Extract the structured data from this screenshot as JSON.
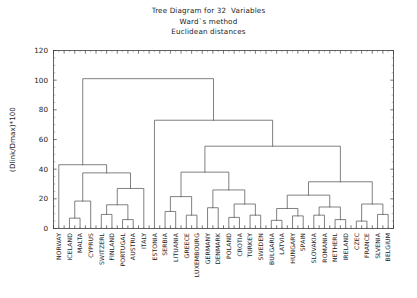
{
  "title": {
    "line1": "Tree Diagram for 32  Variables",
    "line2": "Ward`s method",
    "line3": "Euclidean distances"
  },
  "chart_data": {
    "type": "dendrogram",
    "title": "Tree Diagram for 32  Variables",
    "subtitle": "Ward`s method",
    "subtitle2": "Euclidean distances",
    "xlabel": "",
    "ylabel": "(Dlink/Dmax)*100",
    "ylim": [
      0,
      120
    ],
    "yticks": [
      0,
      20,
      40,
      60,
      80,
      100,
      120
    ],
    "ytick_labels": [
      "0",
      "20",
      "40",
      "60",
      "80",
      "100",
      "120"
    ],
    "grid": false,
    "legend": false,
    "leaf_count": 32,
    "leaves": [
      "NORWAY",
      "ICELAND",
      "MALTA",
      "CYPRUS",
      "SWITZERL",
      "FINLAND",
      "PORTUGAL",
      "AUSTRIA",
      "ITALY",
      "ESTONIA",
      "SERBIA",
      "LITUANIA",
      "GREECE",
      "LUXEMBOURG",
      "GERMANY",
      "DENMARK",
      "POLAND",
      "CROTIA",
      "TURKEY",
      "SWEDEN",
      "BULGARIA",
      "LATVIA",
      "HUNGARY",
      "SPAIN",
      "SLOVAKIA",
      "ROMANIA",
      "NETHERL",
      "IRELAND",
      "CZEC",
      "FRANCE",
      "SLVENIA",
      "BELGIUM"
    ],
    "merges": [
      {
        "id": "m1",
        "left": "ICELAND",
        "right": "MALTA",
        "height": 7.0
      },
      {
        "id": "m2",
        "left": "m1",
        "right": "CYPRUS",
        "height": 18.5
      },
      {
        "id": "m3",
        "left": "SWITZERL",
        "right": "FINLAND",
        "height": 9.5
      },
      {
        "id": "m4",
        "left": "PORTUGAL",
        "right": "AUSTRIA",
        "height": 6.0
      },
      {
        "id": "m5",
        "left": "m3",
        "right": "m4",
        "height": 16.0
      },
      {
        "id": "m6",
        "left": "m5",
        "right": "ITALY",
        "height": 27.0
      },
      {
        "id": "m7",
        "left": "m2",
        "right": "m6",
        "height": 37.5
      },
      {
        "id": "m8",
        "left": "NORWAY",
        "right": "m7",
        "height": 43.0
      },
      {
        "id": "m9",
        "left": "SERBIA",
        "right": "LITUANIA",
        "height": 11.5
      },
      {
        "id": "m10",
        "left": "GREECE",
        "right": "LUXEMBOURG",
        "height": 9.0
      },
      {
        "id": "m11",
        "left": "m9",
        "right": "m10",
        "height": 21.5
      },
      {
        "id": "m12",
        "left": "GERMANY",
        "right": "DENMARK",
        "height": 14.0
      },
      {
        "id": "m13",
        "left": "POLAND",
        "right": "CROTIA",
        "height": 7.5
      },
      {
        "id": "m14",
        "left": "TURKEY",
        "right": "SWEDEN",
        "height": 9.0
      },
      {
        "id": "m15",
        "left": "m13",
        "right": "m14",
        "height": 16.5
      },
      {
        "id": "m16",
        "left": "m12",
        "right": "m15",
        "height": 26.0
      },
      {
        "id": "m17",
        "left": "m11",
        "right": "m16",
        "height": 38.0
      },
      {
        "id": "m18",
        "left": "BULGARIA",
        "right": "LATVIA",
        "height": 5.5
      },
      {
        "id": "m19",
        "left": "HUNGARY",
        "right": "SPAIN",
        "height": 8.5
      },
      {
        "id": "m20",
        "left": "m18",
        "right": "m19",
        "height": 13.5
      },
      {
        "id": "m21",
        "left": "SLOVAKIA",
        "right": "ROMANIA",
        "height": 9.0
      },
      {
        "id": "m22",
        "left": "NETHERL",
        "right": "IRELAND",
        "height": 6.0
      },
      {
        "id": "m23",
        "left": "m21",
        "right": "m22",
        "height": 14.5
      },
      {
        "id": "m24",
        "left": "m20",
        "right": "m23",
        "height": 22.5
      },
      {
        "id": "m25",
        "left": "CZEC",
        "right": "FRANCE",
        "height": 5.0
      },
      {
        "id": "m26",
        "left": "SLVENIA",
        "right": "BELGIUM",
        "height": 9.5
      },
      {
        "id": "m27",
        "left": "m25",
        "right": "m26",
        "height": 16.5
      },
      {
        "id": "m28",
        "left": "m24",
        "right": "m27",
        "height": 31.5
      },
      {
        "id": "m29",
        "left": "m17",
        "right": "m28",
        "height": 55.5
      },
      {
        "id": "m30",
        "left": "ESTONIA",
        "right": "m29",
        "height": 73.0
      },
      {
        "id": "m31",
        "left": "m8",
        "right": "m30",
        "height": 101.0
      }
    ]
  },
  "axis": {
    "y_title": "(Dlink/Dmax)*100"
  }
}
